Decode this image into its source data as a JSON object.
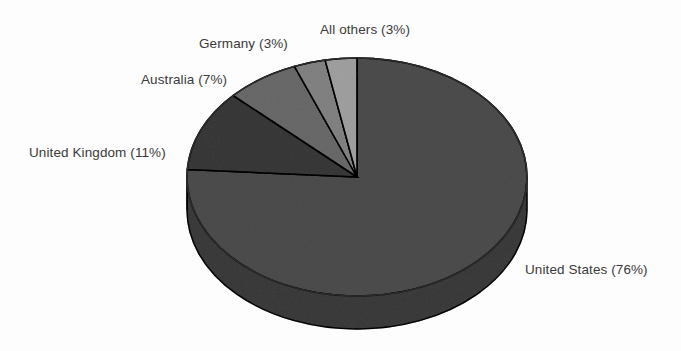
{
  "chart_data": {
    "type": "pie",
    "title": "",
    "subtitle": "",
    "xlabel": "",
    "ylabel": "",
    "grid": false,
    "legend_position": "none",
    "style": "3d-pie-scanned-grayscale",
    "total_percent": 100,
    "start_angle_deg": 90,
    "direction": "counterclockwise-for-small-slices",
    "categories": [
      "United States",
      "United Kingdom",
      "Australia",
      "Germany",
      "All others"
    ],
    "values": [
      76,
      11,
      7,
      3,
      3
    ],
    "value_unit": "%",
    "slices": [
      {
        "name": "United States",
        "value": 76,
        "label": "United States (76%)",
        "color": "#8b8b8b",
        "side_color": "#7b7b7b"
      },
      {
        "name": "United Kingdom",
        "value": 11,
        "label": "United Kingdom (11%)",
        "color": "#787878",
        "side_color": "#6a6a6a"
      },
      {
        "name": "Australia",
        "value": 7,
        "label": "Australia (7%)",
        "color": "#a3a3a3",
        "side_color": "#8f8f8f"
      },
      {
        "name": "Germany",
        "value": 3,
        "label": "Germany (3%)",
        "color": "#b5b5b5",
        "side_color": "#9f9f9f"
      },
      {
        "name": "All others",
        "value": 3,
        "label": "All others (3%)",
        "color": "#c9c9c9",
        "side_color": "#b0b0b0"
      }
    ],
    "colors": {
      "background": "#fdfdfd",
      "outline": "#2b2b2b",
      "label_text": "#3a3a3a"
    }
  },
  "labels": {
    "all_others": "All others (3%)",
    "germany": "Germany (3%)",
    "australia": "Australia (7%)",
    "united_kingdom": "United Kingdom (11%)",
    "united_states": "United States (76%)"
  }
}
